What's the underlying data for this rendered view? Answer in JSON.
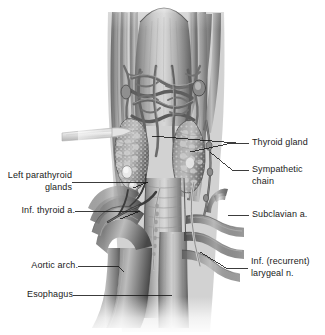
{
  "figure": {
    "style": "grayscale medical illustration",
    "background_color": "#ffffff",
    "ink_color": "#1a1a1a",
    "leader_line_color": "#1a1a1a"
  },
  "labels": {
    "thyroid_gland": "Thyroid gland",
    "sympathetic_chain_line1": "Sympathetic",
    "sympathetic_chain_line2": "chain",
    "subclavian_a": "Subclavian a.",
    "inf_recurrent_laryngeal_line1": "Inf. (recurrent)",
    "inf_recurrent_laryngeal_line2": "larygeal n.",
    "left_parathyroid_line1": "Left parathyroid",
    "left_parathyroid_line2": "glands",
    "inf_thyroid_a": "Inf. thyroid a.",
    "aortic_arch": "Aortic arch.",
    "esophagus": "Esophagus"
  },
  "structures": [
    {
      "name": "thyroid-gland-left-lobe",
      "side": "left"
    },
    {
      "name": "thyroid-gland-right-lobe",
      "side": "right"
    },
    {
      "name": "trachea",
      "side": "center"
    },
    {
      "name": "esophagus",
      "side": "center"
    },
    {
      "name": "aortic-arch",
      "side": "left"
    },
    {
      "name": "subclavian-artery",
      "side": "right"
    },
    {
      "name": "sympathetic-chain",
      "side": "right"
    },
    {
      "name": "inferior-thyroid-artery",
      "side": "left"
    },
    {
      "name": "left-parathyroid-glands",
      "side": "left"
    },
    {
      "name": "recurrent-laryngeal-nerve",
      "side": "right"
    },
    {
      "name": "strap-muscles",
      "side": "both"
    },
    {
      "name": "venous-plexus",
      "side": "center"
    },
    {
      "name": "cut-muscle-band",
      "side": "left"
    }
  ]
}
